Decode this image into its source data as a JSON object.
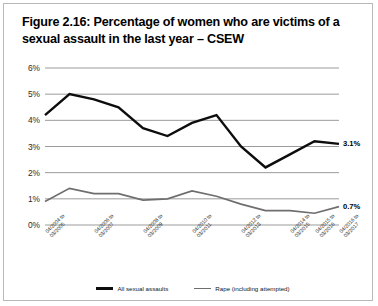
{
  "figure": {
    "title": "Figure 2.16: Percentage of women who are victims of a sexual assault in the last year – CSEW"
  },
  "colors": {
    "series_all_sexual_assaults": "#0d0d0d",
    "series_rape": "#6e6e6e",
    "gridline": "#9b9b9b",
    "frame_border": "#b9b9b9",
    "background": "#ffffff"
  },
  "end_labels": {
    "all_sexual_assaults": "3.1%",
    "rape": "0.7%"
  },
  "legend": {
    "position": "bottom-center",
    "items": [
      {
        "label": "All sexual assaults",
        "color": "#0d0d0d",
        "style": "thick"
      },
      {
        "label": "Rape (including attempted)",
        "color": "#6e6e6e",
        "style": "thin"
      }
    ]
  },
  "chart_data": {
    "type": "line",
    "title": "Figure 2.16: Percentage of women who are victims of a sexual assault in the last year – CSEW",
    "xlabel": "",
    "ylabel": "",
    "ylim": [
      0,
      6
    ],
    "ytick_labels": [
      "0%",
      "1%",
      "2%",
      "3%",
      "4%",
      "5%",
      "6%"
    ],
    "ytick_values": [
      0,
      1,
      2,
      3,
      4,
      5,
      6
    ],
    "grid": true,
    "legend_position": "bottom-center",
    "categories": [
      "04/2004 to 03/2005",
      "04/2005 to 03/2006",
      "04/2006 to 03/2007",
      "04/2007 to 03/2008",
      "04/2008 to 03/2009",
      "04/2009 to 03/2010",
      "04/2010 to 03/2011",
      "04/2011 to 03/2012",
      "04/2012 to 03/2013",
      "04/2013 to 03/2014",
      "04/2014 to 03/2015",
      "04/2015 to 03/2016",
      "04/2016 to 03/2017"
    ],
    "xtick_labels_shown": [
      {
        "index": 0,
        "line1": "04/2004 to",
        "line2": "03/2005"
      },
      {
        "index": 2,
        "line1": "04/2006 to",
        "line2": "03/2007"
      },
      {
        "index": 4,
        "line1": "04/2008 to",
        "line2": "03/2009"
      },
      {
        "index": 6,
        "line1": "04/2010 to",
        "line2": "03/2011"
      },
      {
        "index": 8,
        "line1": "04/2012 to",
        "line2": "03/2013"
      },
      {
        "index": 10,
        "line1": "04/2014 to",
        "line2": "03/2015"
      },
      {
        "index": 11,
        "line1": "04/2015 to",
        "line2": "03/2016"
      },
      {
        "index": 12,
        "line1": "04/2016 to",
        "line2": "03/2017"
      }
    ],
    "series": [
      {
        "name": "All sexual assaults",
        "color": "#0d0d0d",
        "values": [
          4.2,
          5.0,
          4.8,
          4.5,
          3.7,
          3.4,
          3.9,
          4.2,
          3.0,
          2.2,
          2.7,
          3.2,
          3.1
        ],
        "end_label": "3.1%"
      },
      {
        "name": "Rape (including attempted)",
        "color": "#6e6e6e",
        "values": [
          0.9,
          1.4,
          1.2,
          1.2,
          0.95,
          1.0,
          1.3,
          1.1,
          0.8,
          0.55,
          0.55,
          0.45,
          0.7
        ],
        "end_label": "0.7%"
      }
    ]
  }
}
